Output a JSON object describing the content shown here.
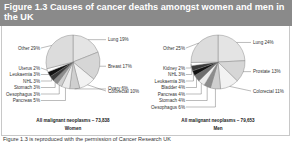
{
  "title": "Figure 1.3  Causes of cancer deaths amongst women and men in the UK",
  "footer": "Figure 1.3 is reproduced with the permission of Cancer Research UK",
  "chart_data": [
    {
      "type": "pie",
      "title": "Women",
      "total_label": "All malignant neoplasms – 73,838",
      "categories": [
        "Lung",
        "Breast",
        "Colorectal",
        "Ovary",
        "Pancreas",
        "Oesophagus",
        "Stomach",
        "NHL",
        "Leukaemia",
        "Uterus",
        "Other"
      ],
      "values": [
        19,
        17,
        10,
        6,
        5,
        3,
        3,
        3,
        3,
        2,
        29
      ],
      "labels": [
        "Lung 19%",
        "Breast 17%",
        "Colorectal 10%",
        "Ovary 6%",
        "Pancreas 5%",
        "Oesophagus 3%",
        "Stomach 3%",
        "NHL 3%",
        "Leukaemia 3%",
        "Uterus 2%",
        "Other 29%"
      ]
    },
    {
      "type": "pie",
      "title": "Men",
      "total_label": "All malignant neoplasms – 79,653",
      "categories": [
        "Lung",
        "Prostate",
        "Colorectal",
        "Oesophagus",
        "Stomach",
        "Pancreas",
        "Bladder",
        "Leukaemia",
        "NHL",
        "Kidney",
        "Other"
      ],
      "values": [
        24,
        13,
        11,
        6,
        4,
        4,
        4,
        3,
        3,
        2,
        25
      ],
      "labels": [
        "Lung 24%",
        "Prostate 13%",
        "Colorectal 11%",
        "Oesophagus 6%",
        "Stomach 4%",
        "Pancreas 4%",
        "Bladder 4%",
        "Leukaemia 3%",
        "NHL 3%",
        "Kidney 2%",
        "Other 25%"
      ]
    }
  ]
}
